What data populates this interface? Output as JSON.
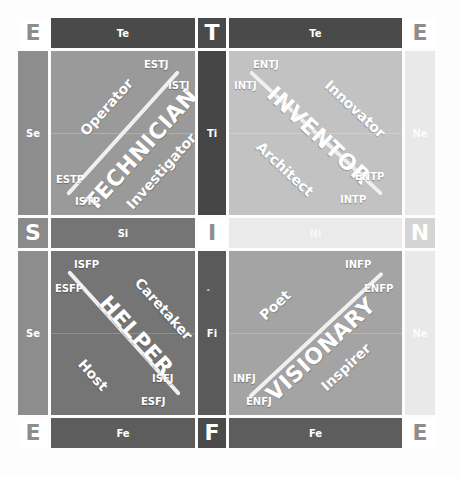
{
  "diagram": {
    "axis_corners": {
      "top_left": "E",
      "top_center": "T",
      "top_right": "E",
      "mid_left": "S",
      "center": "I",
      "mid_right": "N",
      "bottom_left": "E",
      "bottom_center": "F",
      "bottom_right": "E"
    },
    "bands": {
      "top_left": "Te",
      "top_right": "Te",
      "bottom_left": "Fe",
      "bottom_right": "Fe",
      "mid_left": "Si",
      "mid_right": "Ni",
      "left_upper": "Se",
      "left_lower": "Se",
      "right_upper": "Ne",
      "right_lower": "Ne",
      "center_upper": "Ti",
      "center_lower": "Fi"
    },
    "quadrants": [
      {
        "key": "technician",
        "name": "TECHNICIAN",
        "roles": [
          "Operator",
          "Investigator"
        ],
        "types": [
          "ESTJ",
          "ISTJ",
          "ESTP",
          "ISTP"
        ],
        "color": "#9a9a9a"
      },
      {
        "key": "inventor",
        "name": "INVENTOR",
        "roles": [
          "Innovator",
          "Architect"
        ],
        "types": [
          "ENTJ",
          "INTJ",
          "ENTP",
          "INTP"
        ],
        "color": "#c2c2c2"
      },
      {
        "key": "helper",
        "name": "HELPER",
        "roles": [
          "Caretaker",
          "Host"
        ],
        "types": [
          "ISFP",
          "ESFP",
          "ISFJ",
          "ESFJ"
        ],
        "color": "#757575"
      },
      {
        "key": "visionary",
        "name": "VISIONARY",
        "roles": [
          "Poet",
          "Inspirer"
        ],
        "types": [
          "INFP",
          "ENFP",
          "INFJ",
          "ENFJ"
        ],
        "color": "#a4a4a4"
      }
    ],
    "colors": {
      "dark_band": "#4a4a4a",
      "light_band": "#eaeaea",
      "diagonal": "#f0f0f0",
      "page_background": "#ffffff"
    }
  }
}
